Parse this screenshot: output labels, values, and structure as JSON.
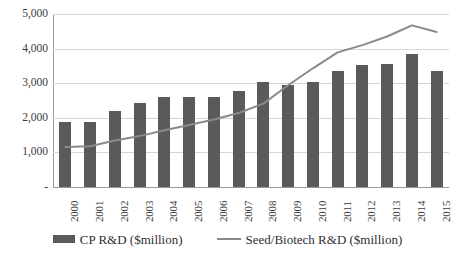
{
  "chart_data": {
    "type": "bar",
    "title": "",
    "subtitle": "",
    "xlabel": "",
    "ylabel": "",
    "ylim": [
      0,
      5000
    ],
    "ytick_values": [
      0,
      1000,
      2000,
      3000,
      4000,
      5000
    ],
    "ytick_labels": [
      "-",
      "1,000",
      "2,000",
      "3,000",
      "4,000",
      "5,000"
    ],
    "grid": true,
    "legend_position": "bottom",
    "categories": [
      "2000",
      "2001",
      "2002",
      "2003",
      "2004",
      "2005",
      "2006",
      "2007",
      "2008",
      "2009",
      "2010",
      "2011",
      "2012",
      "2013",
      "2014",
      "2015"
    ],
    "series": [
      {
        "name": "CP R&D ($million)",
        "type": "bar",
        "color": "#5a5a5a",
        "values": [
          1880,
          1880,
          2190,
          2420,
          2600,
          2600,
          2600,
          2780,
          3030,
          2960,
          3040,
          3350,
          3530,
          3550,
          3850,
          3350
        ]
      },
      {
        "name": "Seed/Biotech R&D ($million)",
        "type": "line",
        "color": "#8a8a8a",
        "values": [
          1160,
          1180,
          1340,
          1470,
          1640,
          1790,
          1950,
          2140,
          2410,
          2940,
          3430,
          3890,
          4100,
          4350,
          4670,
          4480
        ]
      }
    ]
  },
  "legend": {
    "items": [
      {
        "label": "CP R&D ($million)",
        "marker": "bar-swatch"
      },
      {
        "label": "Seed/Biotech R&D ($million)",
        "marker": "line-swatch"
      }
    ]
  },
  "colors": {
    "bar": "#5a5a5a",
    "line": "#8a8a8a",
    "grid": "#d6d6d6",
    "axis": "#9a9a9a",
    "text": "#3a3a3a",
    "background": "#ffffff"
  }
}
